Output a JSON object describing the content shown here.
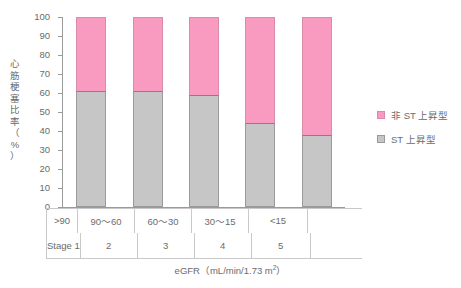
{
  "chart_data": {
    "type": "bar",
    "stacked": true,
    "title": "",
    "xlabel": "eGFR（mL/min/1.73 m²）",
    "ylabel": "心筋梗塞比率（%）",
    "ylabel_chars": "心\n筋\n梗\n塞\n比\n率\n（\n%\n）",
    "ylim": [
      0,
      100
    ],
    "yticks": [
      0,
      10,
      20,
      30,
      40,
      50,
      60,
      70,
      80,
      90,
      100
    ],
    "ytick_labels": [
      "0",
      "10",
      "20",
      "30",
      "40",
      "50",
      "60",
      "70",
      "80",
      "90",
      "100"
    ],
    "grid": false,
    "legend_position": "right",
    "categories": [
      ">90",
      "90〜60",
      "60〜30",
      "30〜15",
      "<15"
    ],
    "stage_labels": [
      "Stage 1",
      "2",
      "3",
      "4",
      "5"
    ],
    "series": [
      {
        "name": "非 ST 上昇型",
        "color": "#f99bc0",
        "values": [
          39,
          39,
          41,
          56,
          62
        ]
      },
      {
        "name": "ST 上昇型",
        "color": "#c6c6c6",
        "values": [
          61,
          61,
          59,
          44,
          38
        ]
      }
    ]
  },
  "axis": {
    "y_title": "心筋梗塞比率（%）",
    "x_title_prefix": "eGFR（mL/min/1.73 m",
    "x_title_sup": "2",
    "x_title_suffix": "）"
  },
  "legend": {
    "items": [
      {
        "label": "非 ST 上昇型",
        "swatch": "pink"
      },
      {
        "label": "ST 上昇型",
        "swatch": "gray"
      }
    ]
  }
}
